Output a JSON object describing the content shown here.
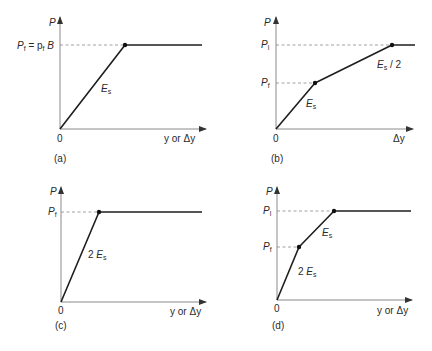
{
  "figure": {
    "panels": [
      {
        "id": "a",
        "caption": "(a)",
        "y_axis_label": "P",
        "x_axis_label": "y or Δy",
        "origin_label": "0",
        "level_labels": [
          {
            "main": "P",
            "sub": "f",
            "rest": " = p",
            "rest_sub": "f",
            "tail": " B"
          }
        ],
        "slope_labels": [
          {
            "prefix": "",
            "main": "E",
            "sub": "s",
            "suffix": ""
          }
        ],
        "curve": [
          [
            0,
            0
          ],
          [
            1,
            1
          ],
          [
            2.3,
            1
          ]
        ]
      },
      {
        "id": "b",
        "caption": "(b)",
        "y_axis_label": "P",
        "x_axis_label": "Δy",
        "origin_label": "0",
        "level_labels": [
          {
            "main": "P",
            "sub": "l"
          },
          {
            "main": "P",
            "sub": "f"
          }
        ],
        "slope_labels": [
          {
            "prefix": "",
            "main": "E",
            "sub": "s",
            "suffix": ""
          },
          {
            "prefix": "",
            "main": "E",
            "sub": "s",
            "suffix": " / 2"
          }
        ],
        "curve": [
          [
            0,
            0
          ],
          [
            1,
            0.55
          ],
          [
            3,
            1
          ],
          [
            3.6,
            1
          ]
        ]
      },
      {
        "id": "c",
        "caption": "(c)",
        "y_axis_label": "P",
        "x_axis_label": "y or Δy",
        "origin_label": "0",
        "level_labels": [
          {
            "main": "P",
            "sub": "f"
          }
        ],
        "slope_labels": [
          {
            "prefix": "2 ",
            "main": "E",
            "sub": "s",
            "suffix": ""
          }
        ],
        "curve": [
          [
            0,
            0
          ],
          [
            0.5,
            1
          ],
          [
            2.3,
            1
          ]
        ]
      },
      {
        "id": "d",
        "caption": "(d)",
        "y_axis_label": "P",
        "x_axis_label": "y or Δy",
        "origin_label": "0",
        "level_labels": [
          {
            "main": "P",
            "sub": "l"
          },
          {
            "main": "P",
            "sub": "f"
          }
        ],
        "slope_labels": [
          {
            "prefix": "2 ",
            "main": "E",
            "sub": "s",
            "suffix": ""
          },
          {
            "prefix": "",
            "main": "E",
            "sub": "s",
            "suffix": ""
          }
        ],
        "curve": [
          [
            0,
            0
          ],
          [
            0.5,
            0.6
          ],
          [
            1.3,
            1
          ],
          [
            3,
            1
          ]
        ]
      }
    ]
  }
}
